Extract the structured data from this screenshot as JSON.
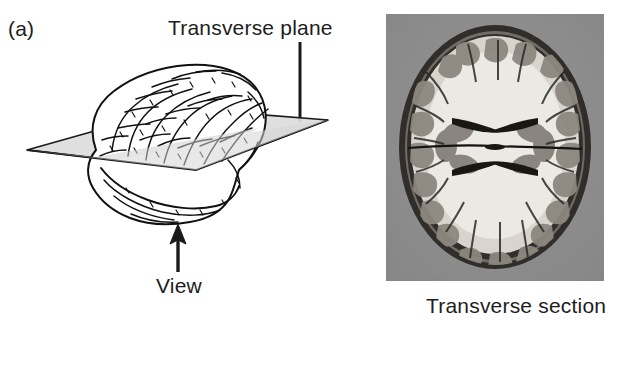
{
  "figure": {
    "panel_label": "(a)",
    "labels": {
      "transverse_plane": "Transverse plane",
      "view": "View",
      "transverse_section": "Transverse section"
    },
    "diagram": {
      "subject": "lateral view of human cerebrum with horizontal cutting plane",
      "plane_name": "transverse-plane",
      "plane_fill": "#d9d9d9",
      "plane_stroke": "#1a1a1a",
      "brain_stroke": "#111111",
      "brain_fill": "#ffffff",
      "leader_line": "vertical-leader-line",
      "view_arrow": "upward-view-arrow"
    },
    "photo": {
      "caption": "Transverse section",
      "background_color": "#8d8d8d",
      "tissue_light": "#e9e6e0",
      "tissue_gray": "#8f8a84",
      "tissue_dark": "#2b2824",
      "skull_color": "#3a3733",
      "description": "axial (transverse) anatomical section of a human brain showing cortex, white matter and lateral ventricles"
    },
    "icons": {
      "arrow_up": "arrow-up-icon"
    }
  }
}
